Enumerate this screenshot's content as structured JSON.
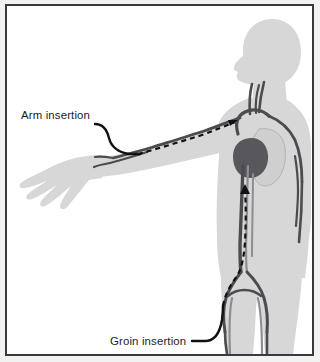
{
  "figure": {
    "frame": {
      "border_color": "#3a3a3c",
      "background_color": "#ffffff",
      "outer_background_color": "#f2f2f1"
    }
  },
  "palette": {
    "body_silhouette": "#d7d7d7",
    "body_shadow": "#c9c9c9",
    "vessel": "#4c4c50",
    "vessel_light": "#8d8d92",
    "heart": "#58585c",
    "lung": "#cfcfcf",
    "catheter": "#111113",
    "leader_line": "#111113",
    "label_text": "#1b1b1d"
  },
  "labels": [
    {
      "id": "arm-insertion",
      "text": "Arm insertion",
      "x": 14,
      "y": 113,
      "anchor": "start"
    },
    {
      "id": "groin-insertion",
      "text": "Groin insertion",
      "x": 103,
      "y": 339,
      "anchor": "start"
    }
  ],
  "anatomy": {
    "parts": [
      "head",
      "neck",
      "torso",
      "left-arm-extended",
      "left-hand",
      "right-arm",
      "legs",
      "heart",
      "lung"
    ],
    "vessels": [
      "aorta",
      "carotid-arteries",
      "subclavian-artery",
      "brachial-artery",
      "femoral-arteries",
      "iliac-bifurcation"
    ]
  },
  "catheters": [
    {
      "id": "arm-catheter",
      "entry": "Arm insertion",
      "style": "dashed",
      "direction": "toward-heart"
    },
    {
      "id": "groin-catheter",
      "entry": "Groin insertion",
      "style": "dashed",
      "direction": "toward-heart",
      "arrow": true
    }
  ]
}
